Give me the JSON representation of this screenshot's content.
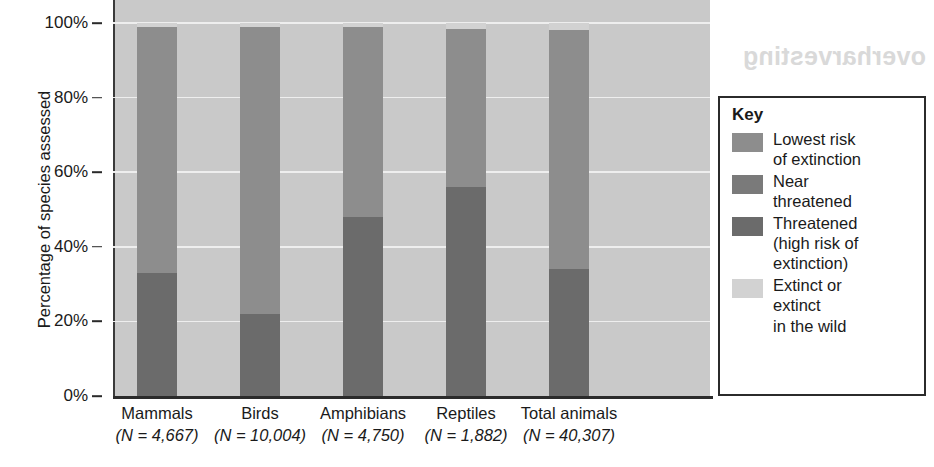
{
  "chart_data": {
    "type": "bar",
    "subtype": "stacked-percentage",
    "title": "",
    "xlabel": "",
    "ylabel": "Percentage of species assessed",
    "ylim": [
      0,
      100
    ],
    "grid": true,
    "legend_position": "right",
    "categories": [
      "Mammals",
      "Birds",
      "Amphibians",
      "Reptiles",
      "Total animals"
    ],
    "category_n_values": [
      "(N = 4,667)",
      "(N = 10,004)",
      "(N = 4,750)",
      "(N = 1,882)",
      "(N = 40,307)"
    ],
    "y_ticks": [
      "0%",
      "20%",
      "40%",
      "60%",
      "80%",
      "100%"
    ],
    "y_tick_values": [
      0,
      20,
      40,
      60,
      80,
      100
    ],
    "series": [
      {
        "name": "Threatened (high risk of extinction)",
        "color": "#6b6b6b",
        "values": [
          33,
          22,
          48,
          56,
          34
        ]
      },
      {
        "name": "Near threatened",
        "color": "#7d7d7d",
        "values": [
          0,
          0,
          0,
          0,
          0
        ]
      },
      {
        "name": "Lowest risk of extinction",
        "color": "#8d8d8d",
        "values": [
          66,
          77,
          51,
          42.5,
          64
        ]
      },
      {
        "name": "Extinct or extinct in the wild",
        "color": "#d2d2d2",
        "values": [
          1,
          1,
          1,
          1.5,
          2
        ]
      }
    ]
  },
  "axis": {
    "y_title": "Percentage of species assessed"
  },
  "legend": {
    "title": "Key",
    "items": [
      {
        "label": "Lowest risk\nof extinction",
        "color": "#8d8d8d",
        "name": "lowest-risk"
      },
      {
        "label": "Near\nthreatened",
        "color": "#7a7a7a",
        "name": "near-threatened"
      },
      {
        "label": "Threatened\n(high risk of\nextinction)",
        "color": "#6b6b6b",
        "name": "threatened"
      },
      {
        "label": "Extinct or\nextinct\nin the wild",
        "color": "#d2d2d2",
        "name": "extinct"
      }
    ]
  },
  "artifacts": {
    "ghost_text": "overharvesting"
  },
  "colors": {
    "plot_background": "#c9c9c9",
    "gridline": "#eeeeee",
    "axis": "#2b2b2b",
    "legend_border": "#2b2b2b"
  }
}
